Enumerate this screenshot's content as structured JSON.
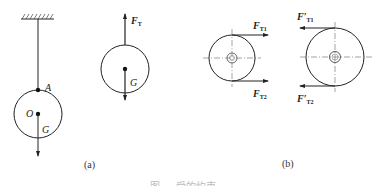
{
  "figure": {
    "caption_partial": "图 … 受的约束",
    "panels": [
      {
        "id": "a",
        "label": "(a)",
        "subfigures": [
          {
            "name": "suspended-ball",
            "labels": {
              "point_A": "A",
              "point_O": "O",
              "weight": "G"
            }
          },
          {
            "name": "ball-free-body",
            "labels": {
              "tension": "F",
              "tension_sub": "T",
              "weight": "G"
            }
          }
        ]
      },
      {
        "id": "b",
        "label": "(b)",
        "subfigures": [
          {
            "name": "pulley-tensions",
            "labels": {
              "f1": "F",
              "f1_sub": "T1",
              "f2": "F",
              "f2_sub": "T2"
            }
          },
          {
            "name": "pulley-reaction-tensions",
            "labels": {
              "f1": "F′",
              "f1_sub": "T1",
              "f2": "F′",
              "f2_sub": "T2"
            }
          }
        ]
      }
    ]
  }
}
